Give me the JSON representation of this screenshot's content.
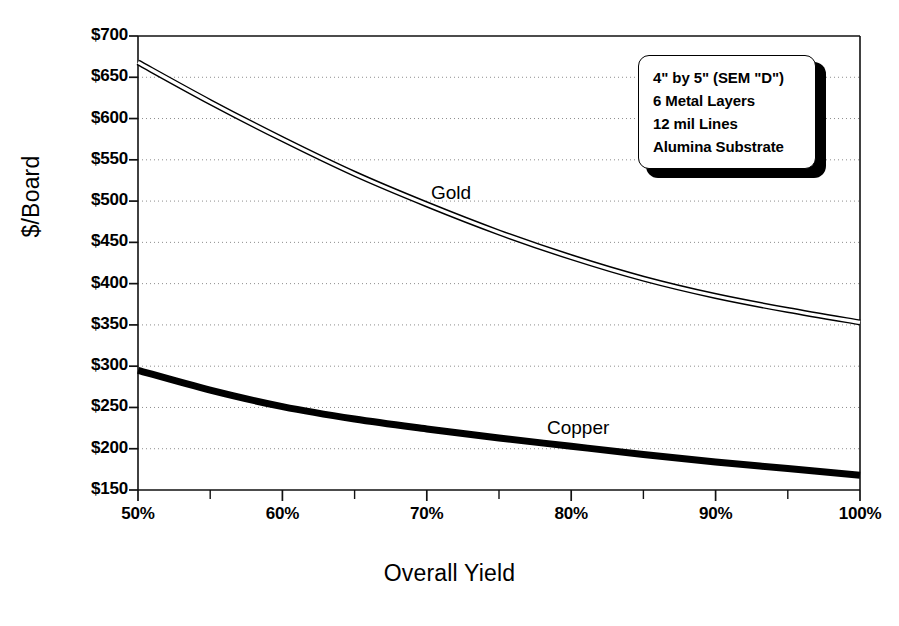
{
  "chart_data": {
    "type": "line",
    "title": "",
    "xlabel": "Overall Yield",
    "ylabel": "$/Board",
    "xlim": [
      50,
      100
    ],
    "ylim": [
      150,
      700
    ],
    "grid": true,
    "grid_axis": "y",
    "legend_position": "none",
    "x_tick_labels": [
      "50%",
      "60%",
      "70%",
      "80%",
      "90%",
      "100%"
    ],
    "x_tick_values": [
      50,
      60,
      70,
      80,
      90,
      100
    ],
    "x_minor_ticks": [
      55,
      65,
      75,
      85,
      95
    ],
    "y_tick_labels": [
      "$700",
      "$650",
      "$600",
      "$550",
      "$500",
      "$450",
      "$400",
      "$350",
      "$300",
      "$250",
      "$200",
      "$150"
    ],
    "y_tick_values": [
      700,
      650,
      600,
      550,
      500,
      450,
      400,
      350,
      300,
      250,
      200,
      150
    ],
    "x": [
      50,
      55,
      60,
      65,
      70,
      75,
      80,
      85,
      90,
      95,
      100
    ],
    "series": [
      {
        "name": "Gold",
        "label": "Gold",
        "color": "#000000",
        "style": "double-line",
        "values": [
          668,
          620,
          575,
          533,
          496,
          462,
          432,
          406,
          385,
          368,
          353
        ]
      },
      {
        "name": "Copper",
        "label": "Copper",
        "color": "#000000",
        "style": "thick-line",
        "values": [
          295,
          271,
          251,
          236,
          224,
          213,
          203,
          193,
          184,
          176,
          168
        ]
      }
    ],
    "annotation_box": {
      "lines": [
        "4\" by 5\" (SEM \"D\")",
        "6 Metal Layers",
        "12 mil Lines",
        "Alumina Substrate"
      ]
    }
  }
}
